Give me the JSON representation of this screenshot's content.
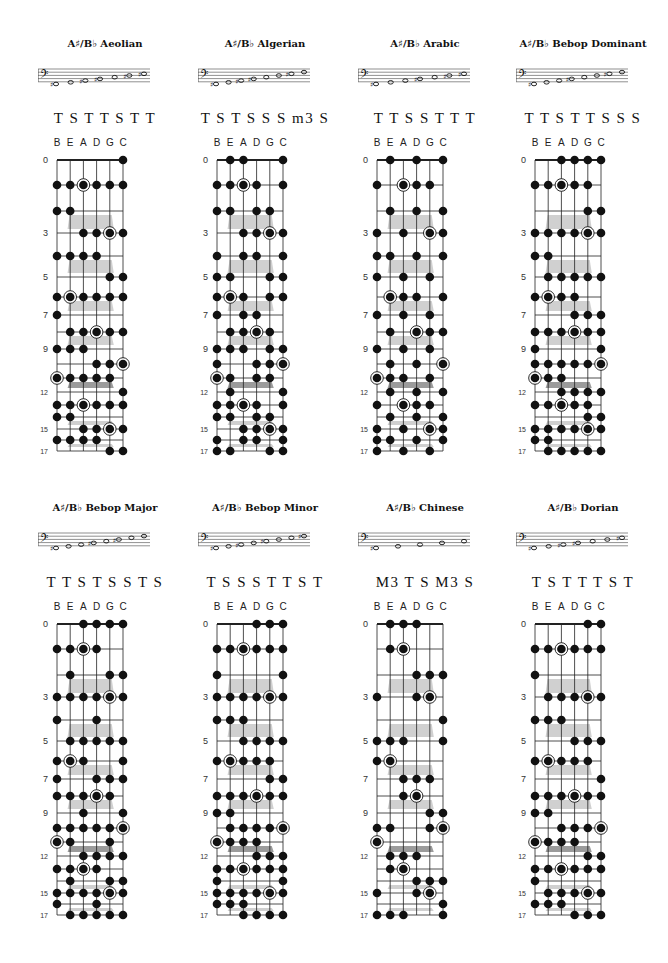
{
  "page": {
    "strings_label": [
      "B",
      "E",
      "A",
      "D",
      "G",
      "C"
    ],
    "fret_numbers_shown": [
      0,
      3,
      5,
      7,
      9,
      12,
      15,
      17
    ],
    "colors": {
      "dot": "#111111",
      "line": "#222222",
      "inlay": "#c8c8c8",
      "inlay_dark": "#8a8a8a"
    }
  },
  "scales": [
    {
      "title": "A♯/B♭ Aeolian",
      "steps": "T S T T S T T",
      "staff_notes": [
        "♯o",
        "o",
        "♯o",
        "♯o",
        "o",
        "♯o",
        "♯o"
      ],
      "frets": {
        "0": [
          5
        ],
        "1": [
          0,
          1,
          2,
          3,
          4,
          5
        ],
        "2": [
          0,
          1
        ],
        "3": [
          2,
          3,
          4,
          5
        ],
        "4": [
          0,
          1,
          2,
          3
        ],
        "5": [
          4,
          5
        ],
        "6": [
          0,
          1,
          2,
          3,
          4,
          5
        ],
        "7": [
          0
        ],
        "8": [
          1,
          2,
          3,
          4,
          5
        ],
        "9": [
          0,
          1,
          2
        ],
        "10": [
          3,
          4,
          5
        ],
        "11": [
          0,
          1,
          2,
          3,
          4
        ],
        "12": [
          5
        ],
        "13": [
          0,
          1,
          2,
          3,
          4,
          5
        ],
        "14": [
          0,
          1
        ],
        "15": [
          2,
          3,
          4,
          5
        ],
        "16": [
          0,
          1,
          2,
          3
        ],
        "17": [
          4,
          5
        ]
      },
      "roots": [
        [
          1,
          2
        ],
        [
          3,
          4
        ],
        [
          6,
          1
        ],
        [
          8,
          3
        ],
        [
          10,
          5
        ],
        [
          11,
          0
        ],
        [
          13,
          2
        ],
        [
          15,
          4
        ]
      ]
    },
    {
      "title": "A♯/B♭ Algerian",
      "steps": "T S T S S S m3 S",
      "staff_notes": [
        "♯o",
        "o",
        "♯o",
        "♯o",
        "o",
        "o",
        "♯o",
        "o"
      ],
      "frets": {
        "0": [
          1,
          2,
          5
        ],
        "1": [
          0,
          1,
          2,
          3,
          5
        ],
        "2": [
          0,
          1,
          3,
          4
        ],
        "3": [
          2,
          3,
          4,
          5
        ],
        "4": [
          0,
          2,
          3,
          5
        ],
        "5": [
          0,
          1,
          4,
          5
        ],
        "6": [
          0,
          1,
          2,
          4,
          5
        ],
        "7": [
          0,
          2,
          3
        ],
        "8": [
          1,
          2,
          3,
          4
        ],
        "9": [
          0,
          1,
          2,
          4,
          5
        ],
        "10": [
          0,
          3,
          4,
          5
        ],
        "11": [
          0,
          1,
          3,
          4
        ],
        "12": [
          1,
          5
        ],
        "13": [
          0,
          1,
          2,
          3,
          5
        ],
        "14": [
          0,
          1,
          3,
          4
        ],
        "15": [
          2,
          3,
          4,
          5
        ],
        "16": [
          0,
          2,
          3,
          5
        ],
        "17": [
          0,
          1,
          4,
          5
        ]
      },
      "roots": [
        [
          1,
          2
        ],
        [
          3,
          4
        ],
        [
          6,
          1
        ],
        [
          8,
          3
        ],
        [
          10,
          5
        ],
        [
          11,
          0
        ],
        [
          13,
          2
        ],
        [
          15,
          4
        ]
      ]
    },
    {
      "title": "A♯/B♭ Arabic",
      "steps": "T T S S T T T",
      "staff_notes": [
        "♯o",
        "o",
        "o",
        "♯o",
        "o",
        "♯o",
        "♯o"
      ],
      "frets": {
        "0": [
          1,
          3,
          5
        ],
        "1": [
          0,
          2,
          3,
          4
        ],
        "2": [
          1,
          3,
          5
        ],
        "3": [
          0,
          2,
          4,
          5
        ],
        "4": [
          0,
          1,
          3,
          5
        ],
        "5": [
          0,
          2,
          4
        ],
        "6": [
          1,
          2,
          3,
          5
        ],
        "7": [
          0,
          2,
          4
        ],
        "8": [
          1,
          3,
          4,
          5
        ],
        "9": [
          0,
          2,
          4
        ],
        "10": [
          1,
          3,
          5
        ],
        "11": [
          0,
          1,
          2,
          4
        ],
        "12": [
          1,
          3,
          5
        ],
        "13": [
          0,
          2,
          3,
          4
        ],
        "14": [
          1,
          3,
          5
        ],
        "15": [
          0,
          2,
          4,
          5
        ],
        "16": [
          0,
          1,
          3,
          5
        ],
        "17": [
          0,
          2,
          4
        ]
      },
      "roots": [
        [
          1,
          2
        ],
        [
          3,
          4
        ],
        [
          6,
          1
        ],
        [
          8,
          3
        ],
        [
          10,
          5
        ],
        [
          11,
          0
        ],
        [
          13,
          2
        ],
        [
          15,
          4
        ]
      ]
    },
    {
      "title": "A♯/B♭ Bebop Dominant",
      "steps": "T T S T T S S S",
      "staff_notes": [
        "♯o",
        "o",
        "o",
        "♯o",
        "o",
        "o",
        "♯o",
        "o"
      ],
      "frets": {
        "0": [
          2,
          3,
          4,
          5
        ],
        "1": [
          0,
          1,
          2,
          3,
          4
        ],
        "2": [
          4,
          5
        ],
        "3": [
          0,
          1,
          2,
          3,
          4,
          5
        ],
        "4": [
          0,
          1
        ],
        "5": [
          1,
          2,
          3,
          4,
          5
        ],
        "6": [
          0,
          1,
          2,
          3
        ],
        "7": [
          3,
          4,
          5
        ],
        "8": [
          0,
          1,
          2,
          3,
          4,
          5
        ],
        "9": [
          0,
          5
        ],
        "10": [
          0,
          1,
          2,
          3,
          4,
          5
        ],
        "11": [
          0,
          1,
          2
        ],
        "12": [
          2,
          3,
          4,
          5
        ],
        "13": [
          0,
          1,
          2,
          3,
          4
        ],
        "14": [
          4,
          5
        ],
        "15": [
          0,
          1,
          2,
          3,
          4,
          5
        ],
        "16": [
          0,
          1
        ],
        "17": [
          1,
          2,
          3,
          4,
          5
        ]
      },
      "roots": [
        [
          1,
          2
        ],
        [
          3,
          4
        ],
        [
          6,
          1
        ],
        [
          8,
          3
        ],
        [
          10,
          5
        ],
        [
          11,
          0
        ],
        [
          13,
          2
        ],
        [
          15,
          4
        ]
      ]
    },
    {
      "title": "A♯/B♭ Bebop Major",
      "steps": "T T S T S S T S",
      "staff_notes": [
        "♯o",
        "o",
        "o",
        "♯o",
        "o",
        "♯o",
        "o",
        "o"
      ],
      "frets": {
        "0": [
          2,
          3,
          4,
          5
        ],
        "1": [
          0,
          1,
          2,
          3
        ],
        "2": [
          1,
          4,
          5
        ],
        "3": [
          0,
          1,
          2,
          3,
          4,
          5
        ],
        "4": [
          0,
          3
        ],
        "5": [
          1,
          2,
          3,
          4,
          5
        ],
        "6": [
          0,
          1,
          2,
          5
        ],
        "7": [
          0,
          3,
          4,
          5
        ],
        "8": [
          0,
          1,
          2,
          3,
          4
        ],
        "9": [
          2,
          5
        ],
        "10": [
          0,
          1,
          2,
          3,
          4,
          5
        ],
        "11": [
          0,
          1,
          4
        ],
        "12": [
          2,
          3,
          4,
          5
        ],
        "13": [
          0,
          1,
          2,
          3
        ],
        "14": [
          1,
          4,
          5
        ],
        "15": [
          0,
          1,
          2,
          3,
          4,
          5
        ],
        "16": [
          0,
          3
        ],
        "17": [
          1,
          2,
          3,
          4,
          5
        ]
      },
      "roots": [
        [
          1,
          2
        ],
        [
          3,
          4
        ],
        [
          6,
          1
        ],
        [
          8,
          3
        ],
        [
          10,
          5
        ],
        [
          11,
          0
        ],
        [
          13,
          2
        ],
        [
          15,
          4
        ]
      ]
    },
    {
      "title": "A♯/B♭ Bebop Minor",
      "steps": "T S S S T T S T",
      "staff_notes": [
        "♯o",
        "o",
        "♯o",
        "o",
        "♯o",
        "o",
        "o",
        "♯o"
      ],
      "frets": {
        "0": [
          3,
          4,
          5
        ],
        "1": [
          0,
          1,
          2,
          3,
          4,
          5
        ],
        "2": [
          0,
          5
        ],
        "3": [
          0,
          1,
          2,
          3,
          4,
          5
        ],
        "4": [
          0,
          1,
          2
        ],
        "5": [
          2,
          3,
          4,
          5
        ],
        "6": [
          0,
          1,
          2,
          3,
          4
        ],
        "7": [
          4,
          5
        ],
        "8": [
          0,
          1,
          2,
          3,
          4,
          5
        ],
        "9": [
          0,
          1
        ],
        "10": [
          1,
          2,
          3,
          4,
          5
        ],
        "11": [
          0,
          1,
          2,
          3
        ],
        "12": [
          3,
          4,
          5
        ],
        "13": [
          0,
          1,
          2,
          3,
          4,
          5
        ],
        "14": [
          0,
          5
        ],
        "15": [
          0,
          1,
          2,
          3,
          4,
          5
        ],
        "16": [
          0,
          1,
          2
        ],
        "17": [
          2,
          3,
          4,
          5
        ]
      },
      "roots": [
        [
          1,
          2
        ],
        [
          3,
          4
        ],
        [
          6,
          1
        ],
        [
          8,
          3
        ],
        [
          10,
          5
        ],
        [
          11,
          0
        ],
        [
          13,
          2
        ],
        [
          15,
          4
        ]
      ]
    },
    {
      "title": "A♯/B♭ Chinese",
      "steps": "M3 T S M3 S",
      "staff_notes": [
        "♯o",
        "o",
        "o",
        "o",
        "o"
      ],
      "frets": {
        "0": [
          1,
          2,
          3
        ],
        "1": [
          1,
          2
        ],
        "2": [
          3,
          4,
          5
        ],
        "3": [
          0,
          3,
          4
        ],
        "4": [
          5
        ],
        "5": [
          0,
          1,
          2,
          5
        ],
        "6": [
          0,
          1
        ],
        "7": [
          2,
          3,
          4
        ],
        "8": [
          2,
          3
        ],
        "9": [
          4,
          5
        ],
        "10": [
          0,
          1,
          4,
          5
        ],
        "11": [
          0
        ],
        "12": [
          1,
          2,
          3
        ],
        "13": [
          1,
          2
        ],
        "14": [
          3,
          4,
          5
        ],
        "15": [
          0,
          3,
          4
        ],
        "16": [
          5
        ],
        "17": [
          0,
          1,
          2,
          5
        ]
      },
      "roots": [
        [
          1,
          2
        ],
        [
          3,
          4
        ],
        [
          6,
          1
        ],
        [
          8,
          3
        ],
        [
          10,
          5
        ],
        [
          11,
          0
        ],
        [
          13,
          2
        ],
        [
          15,
          4
        ]
      ]
    },
    {
      "title": "A♯/B♭ Dorian",
      "steps": "T S T T T S T",
      "staff_notes": [
        "♯o",
        "o",
        "♯o",
        "♯o",
        "o",
        "o",
        "♯o"
      ],
      "frets": {
        "0": [
          4,
          5
        ],
        "1": [
          0,
          1,
          2,
          3,
          4,
          5
        ],
        "2": [
          0
        ],
        "3": [
          1,
          2,
          3,
          4,
          5
        ],
        "4": [
          0,
          1,
          2
        ],
        "5": [
          3,
          4,
          5
        ],
        "6": [
          0,
          1,
          2,
          3,
          4
        ],
        "7": [
          5
        ],
        "8": [
          0,
          1,
          2,
          3,
          4,
          5
        ],
        "9": [
          0,
          1
        ],
        "10": [
          2,
          3,
          4,
          5
        ],
        "11": [
          0,
          1,
          2,
          3
        ],
        "12": [
          4,
          5
        ],
        "13": [
          0,
          1,
          2,
          3,
          4,
          5
        ],
        "14": [
          0
        ],
        "15": [
          1,
          2,
          3,
          4,
          5
        ],
        "16": [
          0,
          1,
          2
        ],
        "17": [
          3,
          4,
          5
        ]
      },
      "roots": [
        [
          1,
          2
        ],
        [
          3,
          4
        ],
        [
          6,
          1
        ],
        [
          8,
          3
        ],
        [
          10,
          5
        ],
        [
          11,
          0
        ],
        [
          13,
          2
        ],
        [
          15,
          4
        ]
      ]
    }
  ]
}
